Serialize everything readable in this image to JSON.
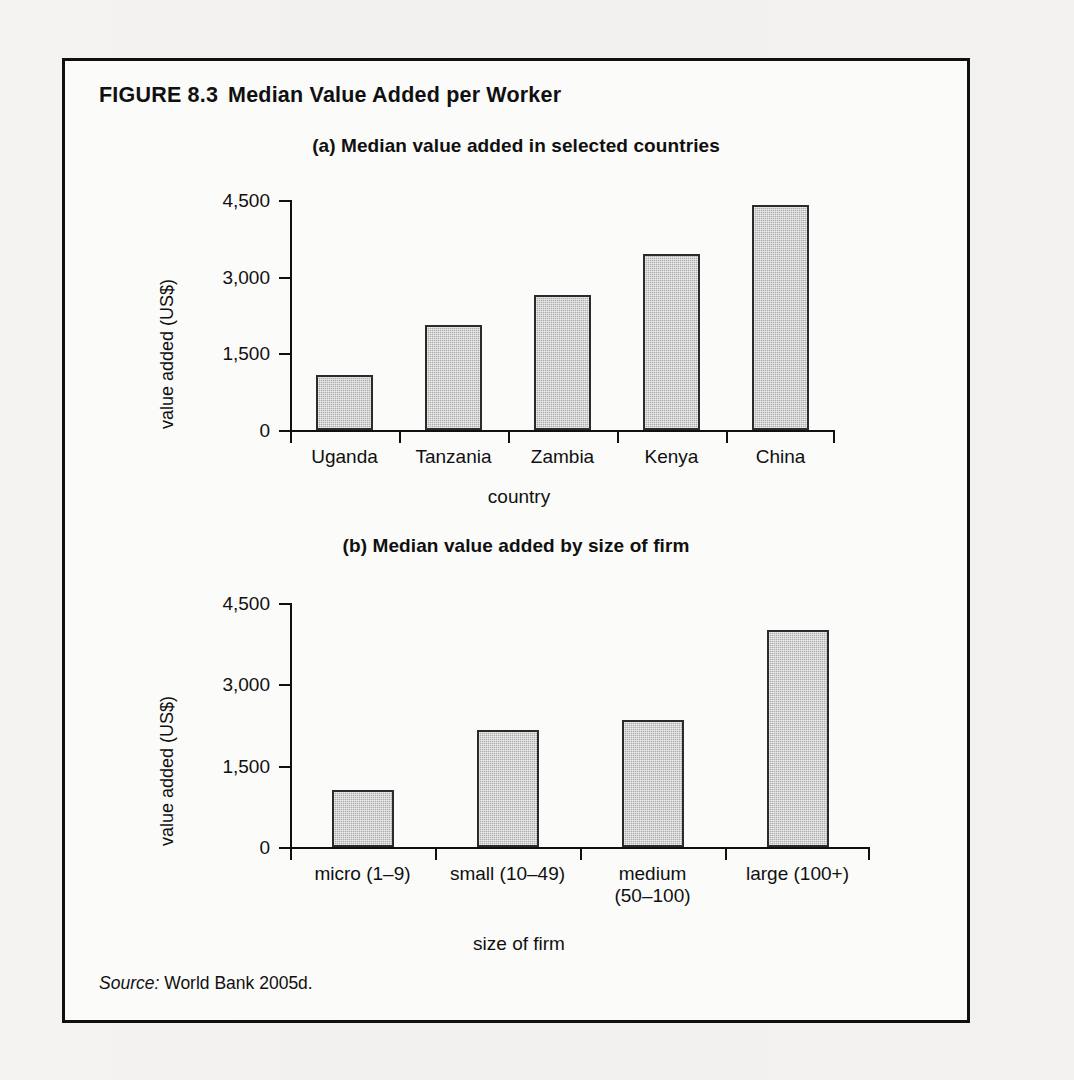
{
  "figure": {
    "number": "FIGURE 8.3",
    "title": "Median Value Added per Worker",
    "source_lead": "Source:",
    "source_text": "World Bank 2005d."
  },
  "chart_data": [
    {
      "id": "panel-a",
      "type": "bar",
      "title": "(a) Median value added in selected countries",
      "categories": [
        "Uganda",
        "Tanzania",
        "Zambia",
        "Kenya",
        "China"
      ],
      "values": [
        1075,
        2050,
        2650,
        3450,
        4400
      ],
      "xlabel": "country",
      "ylabel": "value added (US$)",
      "ylim": [
        0,
        4500
      ],
      "yticks": [
        0,
        1500,
        3000,
        4500
      ],
      "ytick_labels": [
        "0",
        "1,500",
        "3,000",
        "4,500"
      ],
      "grid": false,
      "legend": "none",
      "bar_fill": "#adadad",
      "bar_stroke": "#2b2b2b"
    },
    {
      "id": "panel-b",
      "type": "bar",
      "title": "(b) Median value added by size of firm",
      "categories": [
        "micro (1–9)",
        "small (10–49)",
        "medium\n(50–100)",
        "large (100+)"
      ],
      "values": [
        1050,
        2150,
        2350,
        4000
      ],
      "xlabel": "size of firm",
      "ylabel": "value added (US$)",
      "ylim": [
        0,
        4500
      ],
      "yticks": [
        0,
        1500,
        3000,
        4500
      ],
      "ytick_labels": [
        "0",
        "1,500",
        "3,000",
        "4,500"
      ],
      "grid": false,
      "legend": "none",
      "bar_fill": "#adadad",
      "bar_stroke": "#2b2b2b"
    }
  ]
}
